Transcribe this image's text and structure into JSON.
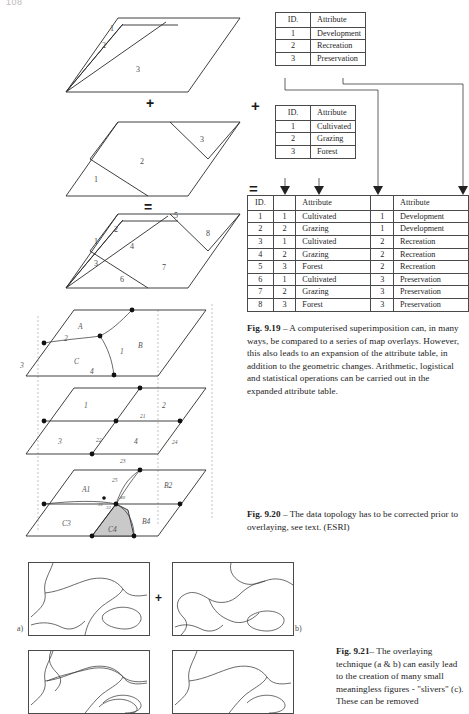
{
  "page": {
    "number": "108"
  },
  "operators": {
    "plus": "+",
    "equals": "="
  },
  "figure_919": {
    "diagram": {
      "layer1_labels": [
        "1",
        "2",
        "3"
      ],
      "layer2_labels": [
        "1",
        "2",
        "3"
      ],
      "result_labels": [
        "1",
        "2",
        "3",
        "4",
        "5",
        "6",
        "7",
        "8"
      ]
    },
    "table_top": {
      "headers": [
        "ID.",
        "Attribute"
      ],
      "rows": [
        [
          "1",
          "Development"
        ],
        [
          "2",
          "Recreation"
        ],
        [
          "3",
          "Preservation"
        ]
      ]
    },
    "table_middle": {
      "headers": [
        "ID.",
        "Attribute"
      ],
      "rows": [
        [
          "1",
          "Cultivated"
        ],
        [
          "2",
          "Grazing"
        ],
        [
          "3",
          "Forest"
        ]
      ]
    },
    "table_combined": {
      "headers": [
        "ID.",
        "",
        "Attribute",
        "",
        "Attribute"
      ],
      "rows": [
        [
          "1",
          "1",
          "Cultivated",
          "1",
          "Development"
        ],
        [
          "2",
          "2",
          "Grazing",
          "1",
          "Development"
        ],
        [
          "3",
          "1",
          "Cultivated",
          "2",
          "Recreation"
        ],
        [
          "4",
          "2",
          "Grazing",
          "2",
          "Recreation"
        ],
        [
          "5",
          "3",
          "Forest",
          "2",
          "Recreation"
        ],
        [
          "6",
          "1",
          "Cultivated",
          "3",
          "Preservation"
        ],
        [
          "7",
          "2",
          "Grazing",
          "3",
          "Preservation"
        ],
        [
          "8",
          "3",
          "Forest",
          "3",
          "Preservation"
        ]
      ]
    },
    "caption": {
      "label": "Fig. 9.19",
      "dash": "–",
      "text": "A computerised superimposition can, in many ways, be compared to a series of map overlays. However, this also leads to an expansion of the attribute table, in addition to the geometric changes. Arithmetic, logistical and statistical operations can be carried out in the expanded attribute table."
    }
  },
  "figure_920": {
    "layer_a": {
      "areas": [
        "A",
        "B",
        "C"
      ],
      "edges": [
        "1",
        "2",
        "3",
        "4"
      ]
    },
    "layer_b": {
      "areas": [
        "1",
        "2",
        "3",
        "4"
      ],
      "edges": [
        "21",
        "22",
        "23",
        "24",
        "25"
      ]
    },
    "layer_c": {
      "areas": [
        "A1",
        "B2",
        "C3",
        "B4",
        "C4"
      ],
      "edges": [
        "31",
        "32",
        "40"
      ]
    },
    "caption": {
      "label": "Fig. 9.20",
      "dash": "–",
      "text": "The data topology has to be corrected prior to overlaying, see text. (ESRI)"
    }
  },
  "figure_921": {
    "panels": [
      {
        "key": "a",
        "label": "a)"
      },
      {
        "key": "b",
        "label": "b)"
      },
      {
        "key": "c",
        "label": ""
      },
      {
        "key": "d",
        "label": ""
      }
    ],
    "operator": "+",
    "caption": {
      "label": "Fig. 9.21",
      "dash": "–",
      "text": "The overlaying technique (a & b) can easily lead to the creation of many small meaningless figures - \"slivers\" (c). These can be removed"
    }
  },
  "colors": {
    "ink": "#2b2b2b",
    "paper": "#ffffff",
    "shade": "#c9c9c9",
    "caption_text": "#232323"
  }
}
